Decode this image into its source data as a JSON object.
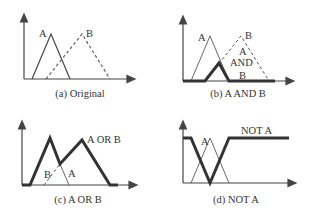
{
  "figure": {
    "panels": [
      {
        "id": "a",
        "caption": "(a) Original",
        "labels": {
          "A": "A",
          "B": "B"
        }
      },
      {
        "id": "b",
        "caption": "(b) A AND B",
        "labels": {
          "A": "A",
          "B": "B",
          "result_line1": "A",
          "result_line2": "AND",
          "result_line3": "B"
        }
      },
      {
        "id": "c",
        "caption": "(c) A OR B",
        "labels": {
          "A": "A",
          "B": "B",
          "result": "A OR B"
        }
      },
      {
        "id": "d",
        "caption": "(d) NOT A",
        "labels": {
          "A": "A",
          "result": "NOT A"
        }
      }
    ],
    "colors": {
      "line": "#3a3a3a",
      "thin_line": "#555555",
      "background": "#ffffff"
    }
  }
}
